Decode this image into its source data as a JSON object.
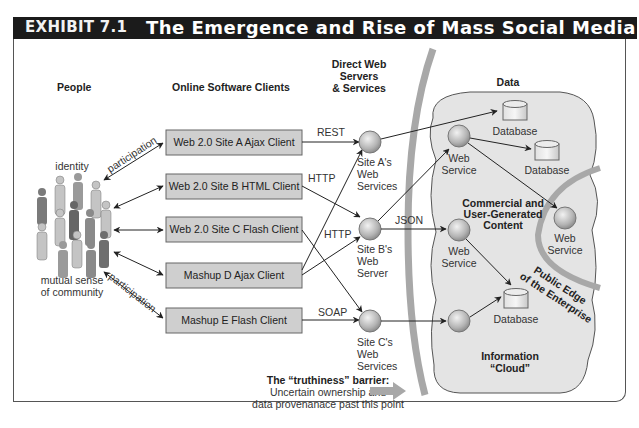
{
  "header": {
    "exhibit": "EXHIBIT 7.1",
    "title": "The Emergence and Rise of Mass Social Media"
  },
  "columns": {
    "people": "People",
    "clients": "Online Software Clients",
    "servers_line1": "Direct Web",
    "servers_line2": "Servers",
    "servers_line3": "& Services",
    "data": "Data"
  },
  "people": {
    "identity": "identity",
    "community_line1": "mutual sense",
    "community_line2": "of community",
    "participation_top": "participation",
    "participation_bottom": "participation"
  },
  "clients": [
    {
      "label": "Web 2.0 Site A Ajax Client"
    },
    {
      "label": "Web 2.0 Site B HTML Client"
    },
    {
      "label": "Web 2.0 Site C Flash Client"
    },
    {
      "label": "Mashup D Ajax Client"
    },
    {
      "label": "Mashup E Flash Client"
    }
  ],
  "protocols": {
    "rest": "REST",
    "http1": "HTTP",
    "http2": "HTTP",
    "soap": "SOAP",
    "json": "JSON"
  },
  "servers": [
    {
      "line1": "Site A's",
      "line2": "Web",
      "line3": "Services"
    },
    {
      "line1": "Site B's",
      "line2": "Web",
      "line3": "Server"
    },
    {
      "line1": "Site C's",
      "line2": "Web",
      "line3": "Services"
    }
  ],
  "cloud": {
    "web_service": "Web",
    "web_service2": "Service",
    "database": "Database",
    "commercial_line1": "Commercial and",
    "commercial_line2": "User-Generated",
    "commercial_line3": "Content",
    "info_line1": "Information",
    "info_line2": "“Cloud”",
    "edge_line1": "Public Edge",
    "edge_line2": "of the Enterprise"
  },
  "barrier": {
    "title": "The “truthiness” barrier:",
    "line1": "Uncertain ownership and",
    "line2": "data provenanace past this point"
  },
  "colors": {
    "header_bg": "#1b1b1b",
    "box_fill": "#cfcfcf",
    "cloud_fill": "#e4e4e4",
    "barrier": "#a8a8a8",
    "node": "#bdbdbd"
  }
}
